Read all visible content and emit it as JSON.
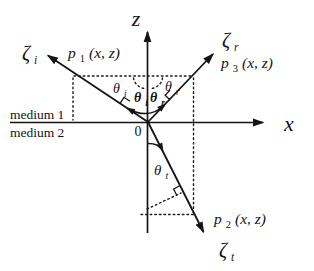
{
  "figure": {
    "axes": {
      "z": "z",
      "x": "x",
      "origin": "0"
    },
    "media": {
      "upper": "medium 1",
      "lower": "medium 2"
    },
    "waves": {
      "incident": {
        "zeta": "ζ",
        "zeta_sub": "i",
        "p": "p",
        "p_sub": "1",
        "p_args": "(x, z)"
      },
      "reflected": {
        "zeta": "ζ",
        "zeta_sub": "r",
        "p": "p",
        "p_sub": "3",
        "p_args": "(x, z)"
      },
      "transmitted": {
        "zeta": "ζ",
        "zeta_sub": "t",
        "p": "p",
        "p_sub": "2",
        "p_args": "(x, z)"
      }
    },
    "angles": {
      "theta_i_outer": {
        "sym": "θ",
        "sub": "i"
      },
      "theta_i_inner": {
        "sym": "θ",
        "sub": "i"
      },
      "theta_r_inner": {
        "sym": "θ",
        "sub": "r"
      },
      "theta_r_outer": {
        "sym": "θ",
        "sub": "r"
      },
      "theta_t": {
        "sym": "θ",
        "sub": "t"
      }
    },
    "colors": {
      "ink": "#141414",
      "background": "#ffffff"
    }
  }
}
